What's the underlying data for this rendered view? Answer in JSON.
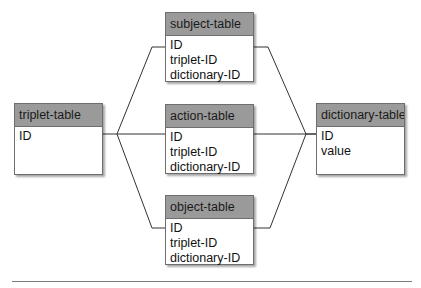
{
  "tables": {
    "triplet": {
      "title": "triplet-table",
      "fields": [
        "ID"
      ]
    },
    "subject": {
      "title": "subject-table",
      "fields": [
        "ID",
        "triplet-ID",
        "dictionary-ID"
      ]
    },
    "action": {
      "title": "action-table",
      "fields": [
        "ID",
        "triplet-ID",
        "dictionary-ID"
      ]
    },
    "object": {
      "title": "object-table",
      "fields": [
        "ID",
        "triplet-ID",
        "dictionary-ID"
      ]
    },
    "dictionary": {
      "title": "dictionary-table",
      "fields": [
        "ID",
        "value"
      ]
    }
  },
  "colors": {
    "header": "#9a9a9a",
    "border": "#6e6e6e",
    "line": "#333333"
  }
}
